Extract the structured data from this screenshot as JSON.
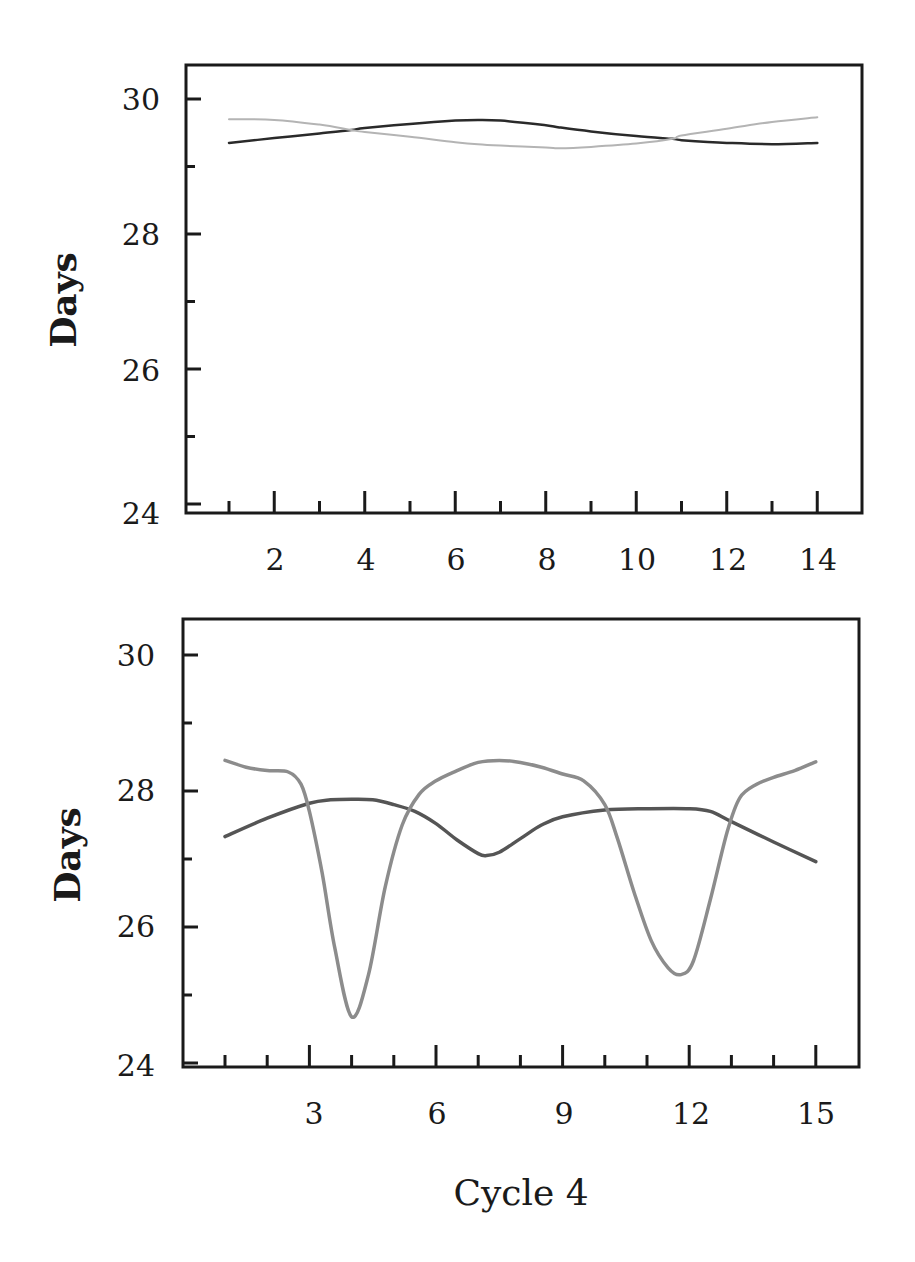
{
  "chart_data": [
    {
      "type": "line",
      "title": "",
      "xlabel": "",
      "ylabel": "Days",
      "ylim": [
        24,
        30.5
      ],
      "xlim": [
        0,
        15.2
      ],
      "yticks": [
        24,
        26,
        28,
        30
      ],
      "yticks_minor": [
        25,
        27,
        29
      ],
      "xticks": [
        2,
        4,
        6,
        8,
        10,
        12,
        14
      ],
      "xticks_minor": [
        1,
        3,
        5,
        7,
        9,
        11,
        13
      ],
      "grid": false,
      "legend": "none",
      "x": [
        1,
        2,
        3,
        3.7,
        4,
        5,
        6,
        6.5,
        7,
        8,
        8.3,
        9,
        10,
        10.8,
        11,
        12,
        13,
        14
      ],
      "series": [
        {
          "name": "dark-series",
          "color": "#2a2a2a",
          "width": 2.5,
          "values": [
            29.35,
            29.42,
            29.49,
            29.54,
            29.57,
            29.63,
            29.68,
            29.69,
            29.68,
            29.61,
            29.58,
            29.52,
            29.45,
            29.41,
            29.39,
            29.35,
            29.33,
            29.35
          ]
        },
        {
          "name": "light-series",
          "color": "#b4b4b4",
          "width": 2,
          "values": [
            29.7,
            29.69,
            29.62,
            29.54,
            29.51,
            29.44,
            29.36,
            29.33,
            29.31,
            29.28,
            29.27,
            29.29,
            29.34,
            29.41,
            29.46,
            29.56,
            29.66,
            29.73
          ]
        }
      ]
    },
    {
      "type": "line",
      "title": "",
      "xlabel": "Cycle 4",
      "ylabel": "Days",
      "ylim": [
        24,
        30.5
      ],
      "xlim": [
        0,
        16
      ],
      "yticks": [
        24,
        26,
        28,
        30
      ],
      "yticks_minor": [
        25,
        27,
        29
      ],
      "xticks": [
        3,
        6,
        9,
        12,
        15
      ],
      "xticks_minor": [
        1,
        2,
        4,
        5,
        7,
        8,
        10,
        11,
        13,
        14
      ],
      "grid": false,
      "legend": "none",
      "series": [
        {
          "name": "dark-series",
          "color": "#555555",
          "width": 3.5,
          "x": [
            1,
            2,
            3,
            3.5,
            4,
            4.5,
            5,
            5.5,
            6,
            6.5,
            7,
            7.2,
            7.5,
            8,
            8.5,
            9,
            10,
            11,
            12,
            12.5,
            13,
            14,
            15
          ],
          "values": [
            27.33,
            27.6,
            27.82,
            27.87,
            27.88,
            27.87,
            27.8,
            27.7,
            27.52,
            27.28,
            27.08,
            27.05,
            27.1,
            27.3,
            27.5,
            27.62,
            27.72,
            27.74,
            27.74,
            27.7,
            27.55,
            27.25,
            26.96
          ]
        },
        {
          "name": "light-series",
          "color": "#8c8c8c",
          "width": 3.5,
          "x": [
            1,
            1.5,
            2,
            2.5,
            2.8,
            3,
            3.3,
            3.6,
            4,
            4.4,
            4.8,
            5.2,
            5.6,
            6,
            6.5,
            7,
            7.5,
            8,
            8.5,
            9,
            9.5,
            10,
            10.3,
            10.7,
            11.1,
            11.5,
            11.8,
            12.1,
            12.5,
            12.9,
            13.2,
            13.6,
            14,
            14.5,
            15
          ],
          "values": [
            28.45,
            28.35,
            28.3,
            28.28,
            28.1,
            27.7,
            26.8,
            25.7,
            24.68,
            25.3,
            26.6,
            27.5,
            27.95,
            28.15,
            28.3,
            28.42,
            28.45,
            28.42,
            28.35,
            28.25,
            28.15,
            27.8,
            27.3,
            26.5,
            25.8,
            25.4,
            25.3,
            25.5,
            26.4,
            27.4,
            27.9,
            28.1,
            28.2,
            28.3,
            28.43
          ]
        }
      ]
    }
  ],
  "charts": [
    {
      "ylabel": "Days",
      "ytick_labels": [
        "30",
        "28",
        "26",
        "24"
      ],
      "xtick_labels": [
        "2",
        "4",
        "6",
        "8",
        "10",
        "12",
        "14"
      ]
    },
    {
      "ylabel": "Days",
      "xlabel": "Cycle 4",
      "ytick_labels": [
        "30",
        "28",
        "26",
        "24"
      ],
      "xtick_labels": [
        "3",
        "6",
        "9",
        "12",
        "15"
      ]
    }
  ]
}
